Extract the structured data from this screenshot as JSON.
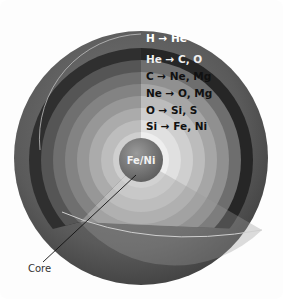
{
  "diagram": {
    "shells": [
      {
        "label": "H → He",
        "color": "#2f2f2f",
        "text_color": "#ffffff"
      },
      {
        "label": "He → C, O",
        "color": "#6b6b6b",
        "text_color": "#f0f0f0"
      },
      {
        "label": "C → Ne, Mg",
        "color": "#8a8a8a",
        "text_color": "#111111"
      },
      {
        "label": "Ne → O, Mg",
        "color": "#a2a2a2",
        "text_color": "#111111"
      },
      {
        "label": "O → Si, S",
        "color": "#bababa",
        "text_color": "#111111"
      },
      {
        "label": "Si → Fe, Ni",
        "color": "#d0d0d0",
        "text_color": "#111111"
      }
    ],
    "core": {
      "label": "Fe/Ni",
      "color": "#7a7a7a"
    },
    "callout": {
      "label": "Core"
    },
    "outer_surface_color": "#5e5e5e"
  }
}
